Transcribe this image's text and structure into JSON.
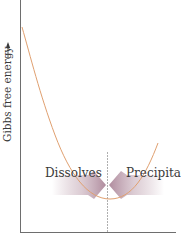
{
  "diagram": {
    "y_axis_label": "Gibbs free energy",
    "y_axis_arrow": "→",
    "left_region_label": "Dissolves",
    "right_region_label": "Precipitates",
    "colors": {
      "axis": "#6e6e6e",
      "curve": "#e0a070",
      "divider": "#9a9a9a",
      "arrow": "#b89aa8",
      "text": "#3a3a3a"
    }
  }
}
